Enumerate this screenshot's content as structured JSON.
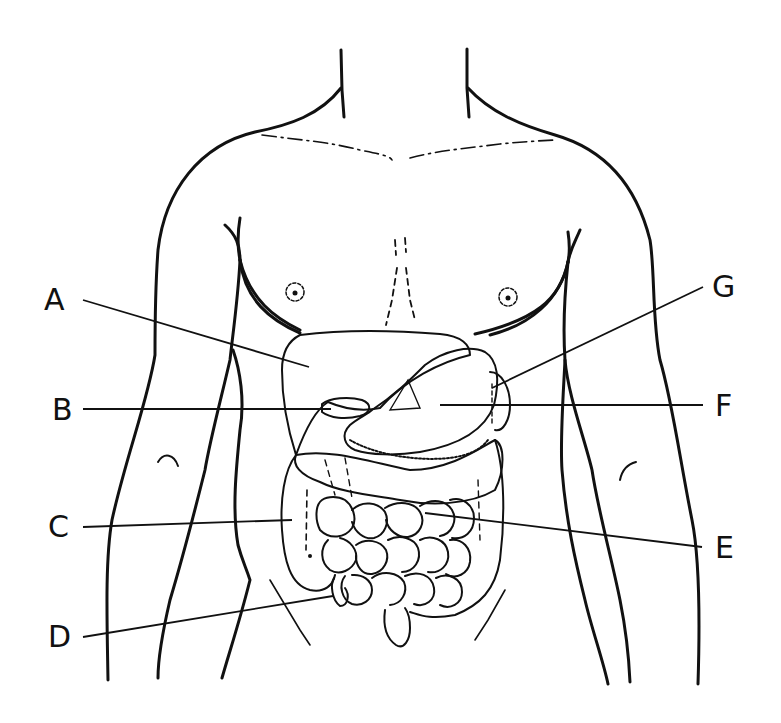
{
  "figure": {
    "line_color": "#111111",
    "background": "#ffffff"
  },
  "labels": [
    {
      "id": "A",
      "text": "A",
      "side": "left",
      "x": 44,
      "y": 285,
      "points_to": "liver"
    },
    {
      "id": "B",
      "text": "B",
      "side": "left",
      "x": 52,
      "y": 395,
      "points_to": "gallbladder"
    },
    {
      "id": "C",
      "text": "C",
      "side": "left",
      "x": 48,
      "y": 512,
      "points_to": "ascending colon"
    },
    {
      "id": "D",
      "text": "D",
      "side": "left",
      "x": 48,
      "y": 622,
      "points_to": "appendix"
    },
    {
      "id": "E",
      "text": "E",
      "side": "right",
      "x": 715,
      "y": 537,
      "points_to": "small intestine"
    },
    {
      "id": "F",
      "text": "F",
      "side": "right",
      "x": 715,
      "y": 395,
      "points_to": "stomach"
    },
    {
      "id": "G",
      "text": "G",
      "side": "right",
      "x": 712,
      "y": 272,
      "points_to": "spleen"
    }
  ]
}
